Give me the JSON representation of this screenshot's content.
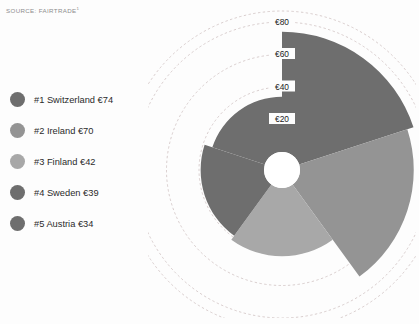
{
  "source": {
    "text": "SOURCE: FAIRTRADE",
    "superscript": "1"
  },
  "legend": {
    "items": [
      {
        "label": "#1 Switzerland €74",
        "color": "#6e6e6e",
        "name": "legend-item-switzerland"
      },
      {
        "label": "#2 Ireland €70",
        "color": "#949494",
        "name": "legend-item-ireland"
      },
      {
        "label": "#3 Finland €42",
        "color": "#a8a8a8",
        "name": "legend-item-finland"
      },
      {
        "label": "#4 Sweden €39",
        "color": "#6e6e6e",
        "name": "legend-item-sweden"
      },
      {
        "label": "#5 Austria €34",
        "color": "#6e6e6e",
        "name": "legend-item-austria"
      }
    ]
  },
  "chart_data": {
    "type": "bar",
    "variant": "polar-rose",
    "title": "",
    "xlabel": "",
    "ylabel": "",
    "categories": [
      "Switzerland",
      "Ireland",
      "Finland",
      "Sweden",
      "Austria"
    ],
    "ranks": [
      "#1",
      "#2",
      "#3",
      "#4",
      "#5"
    ],
    "values": [
      74,
      70,
      42,
      39,
      34
    ],
    "currency": "€",
    "unit": "EUR",
    "colors": [
      "#6e6e6e",
      "#949494",
      "#a8a8a8",
      "#6e6e6e",
      "#6e6e6e"
    ],
    "rlim": [
      0,
      80
    ],
    "ticks": [
      20,
      40,
      60,
      80
    ],
    "tick_labels": [
      "€20",
      "€40",
      "€60",
      "€80"
    ],
    "grid": true,
    "grid_style": "dashed",
    "legend_position": "left",
    "start_angle_deg": 0,
    "direction": "clockwise",
    "sector_span_deg": 72,
    "inner_hole": true
  },
  "axis": {
    "tick_labels": [
      "€80",
      "€60",
      "€40",
      "€20"
    ]
  },
  "colors": {
    "background": "#fdfdfd",
    "grid": "#c9b9b9",
    "text": "#2b2b2b",
    "source_text": "#8d8d8d",
    "hub": "#ffffff"
  }
}
